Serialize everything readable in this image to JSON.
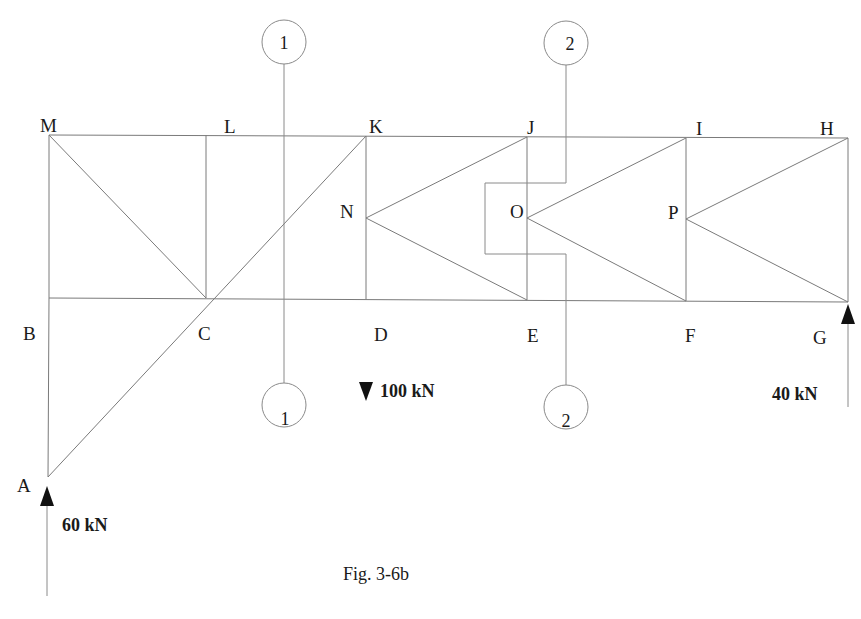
{
  "figure": {
    "caption": "Fig. 3-6b",
    "type": "truss-section-diagram"
  },
  "nodes": {
    "A": {
      "label": "A",
      "x": 48,
      "y": 477
    },
    "B": {
      "label": "B",
      "x": 49,
      "y": 298
    },
    "C": {
      "label": "C",
      "x": 206,
      "y": 298
    },
    "D": {
      "label": "D",
      "x": 366,
      "y": 299
    },
    "E": {
      "label": "E",
      "x": 527,
      "y": 300
    },
    "F": {
      "label": "F",
      "x": 686,
      "y": 301
    },
    "G": {
      "label": "G",
      "x": 848,
      "y": 302
    },
    "H": {
      "label": "H",
      "x": 848,
      "y": 138
    },
    "I": {
      "label": "I",
      "x": 686,
      "y": 138
    },
    "J": {
      "label": "J",
      "x": 527,
      "y": 137
    },
    "K": {
      "label": "K",
      "x": 366,
      "y": 136
    },
    "L": {
      "label": "L",
      "x": 206,
      "y": 135
    },
    "M": {
      "label": "M",
      "x": 49,
      "y": 135
    },
    "N": {
      "label": "N",
      "x": 366,
      "y": 218
    },
    "O": {
      "label": "O",
      "x": 527,
      "y": 218
    },
    "P": {
      "label": "P",
      "x": 686,
      "y": 219
    }
  },
  "members": [
    [
      "M",
      "H"
    ],
    [
      "B",
      "G"
    ],
    [
      "M",
      "B"
    ],
    [
      "B",
      "A"
    ],
    [
      "L",
      "C"
    ],
    [
      "K",
      "D"
    ],
    [
      "J",
      "E"
    ],
    [
      "I",
      "F"
    ],
    [
      "H",
      "G"
    ],
    [
      "M",
      "C"
    ],
    [
      "A",
      "K"
    ],
    [
      "N",
      "J"
    ],
    [
      "N",
      "E"
    ],
    [
      "O",
      "I"
    ],
    [
      "O",
      "F"
    ],
    [
      "P",
      "H"
    ],
    [
      "P",
      "G"
    ]
  ],
  "sections": [
    {
      "id": "1",
      "top_label": "1",
      "bottom_label": "1"
    },
    {
      "id": "2",
      "top_label": "2",
      "bottom_label": "2"
    }
  ],
  "loads": [
    {
      "id": "reaction-A",
      "label": "60 kN",
      "node": "A",
      "direction": "up"
    },
    {
      "id": "load-D",
      "label": "100 kN",
      "node": "D",
      "direction": "down"
    },
    {
      "id": "reaction-G",
      "label": "40 kN",
      "node": "G",
      "direction": "up"
    }
  ],
  "colors": {
    "line": "#7a7a7a",
    "text": "#1a1a1a",
    "arrow": "#111111",
    "background": "#ffffff"
  }
}
